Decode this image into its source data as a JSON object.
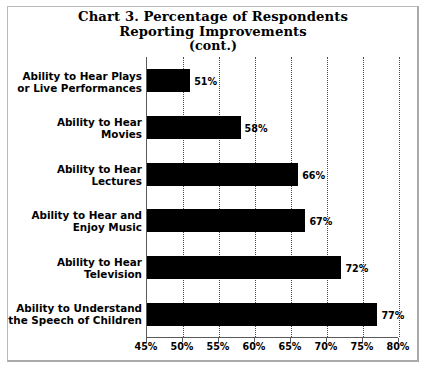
{
  "chart_data": {
    "type": "bar",
    "orientation": "horizontal",
    "title": "Chart 3. Percentage of Respondents Reporting Improvements (cont.)",
    "title_lines": [
      "Chart 3. Percentage of Respondents",
      "Reporting Improvements",
      "(cont.)"
    ],
    "categories": [
      "Ability to Hear Plays or Live Performances",
      "Ability to Hear Movies",
      "Ability to Hear Lectures",
      "Ability to Hear and Enjoy Music",
      "Ability to Hear Television",
      "Ability to Understand the Speech of Children"
    ],
    "category_lines": [
      [
        "Ability to Hear Plays",
        "or Live Performances"
      ],
      [
        "Ability to Hear",
        "Movies"
      ],
      [
        "Ability to Hear",
        "Lectures"
      ],
      [
        "Ability to Hear and",
        "Enjoy Music"
      ],
      [
        "Ability to Hear",
        "Television"
      ],
      [
        "Ability to Understand",
        "the Speech of Children"
      ]
    ],
    "values": [
      51,
      58,
      66,
      67,
      72,
      77
    ],
    "value_labels": [
      "51%",
      "58%",
      "66%",
      "67%",
      "72%",
      "77%"
    ],
    "xlabel": "",
    "ylabel": "",
    "xlim": [
      45,
      80
    ],
    "xticks": [
      45,
      50,
      55,
      60,
      65,
      70,
      75,
      80
    ],
    "xtick_labels": [
      "45%",
      "50%",
      "55%",
      "60%",
      "65%",
      "70%",
      "75%",
      "80%"
    ],
    "grid": true,
    "grid_axis": "x",
    "grid_style": "dotted",
    "legend": false,
    "bar_color": "#000000",
    "plot_background": "#ffffff",
    "axis_color": "#5a5a5a"
  }
}
